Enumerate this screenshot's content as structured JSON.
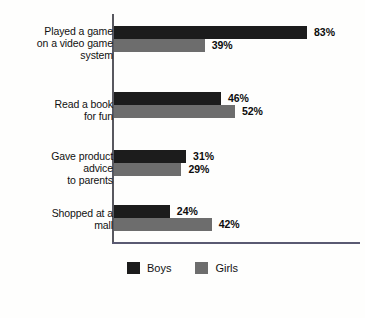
{
  "chart_data": {
    "type": "bar",
    "orientation": "horizontal",
    "title": "",
    "subtitle": "",
    "xlabel": "",
    "ylabel": "",
    "xlim": [
      0,
      100
    ],
    "grid": false,
    "legend_position": "bottom-center",
    "categories": [
      "Played a game\non a video game\nsystem",
      "Read a book\nfor fun",
      "Gave product\nadvice\nto parents",
      "Shopped at a\nmall"
    ],
    "series": [
      {
        "name": "Boys",
        "color": "#1c1c1c",
        "values": [
          83,
          46,
          31,
          24
        ],
        "labels": [
          "83%",
          "46%",
          "31%",
          "24%"
        ]
      },
      {
        "name": "Girls",
        "color": "#6d6d6d",
        "values": [
          39,
          52,
          29,
          42
        ],
        "labels": [
          "39%",
          "52%",
          "29%",
          "42%"
        ]
      }
    ],
    "value_suffix": "%"
  },
  "legend": {
    "items": [
      {
        "label": "Boys",
        "color": "#1c1c1c"
      },
      {
        "label": "Girls",
        "color": "#6d6d6d"
      }
    ]
  },
  "colors": {
    "boys": "#1c1c1c",
    "girls": "#6d6d6d",
    "axis": "#58585f",
    "text": "#111111",
    "background": "#fefefd"
  }
}
